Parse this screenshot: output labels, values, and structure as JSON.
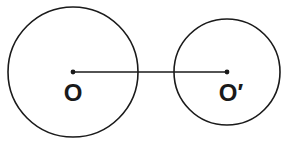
{
  "diagram": {
    "stroke_color": "#1a1a1a",
    "background": "#ffffff",
    "circles": [
      {
        "id": "circle-o",
        "cx": 73,
        "cy": 72,
        "r": 65,
        "center_label": "O"
      },
      {
        "id": "circle-o-prime",
        "cx": 227,
        "cy": 72,
        "r": 53,
        "center_label": "O′"
      }
    ],
    "center_line": {
      "from": "O",
      "to": "O′",
      "x1": 73,
      "y1": 72,
      "x2": 227,
      "y2": 72
    },
    "labels": {
      "o": "O",
      "o_prime": "O′"
    },
    "caption": ""
  }
}
